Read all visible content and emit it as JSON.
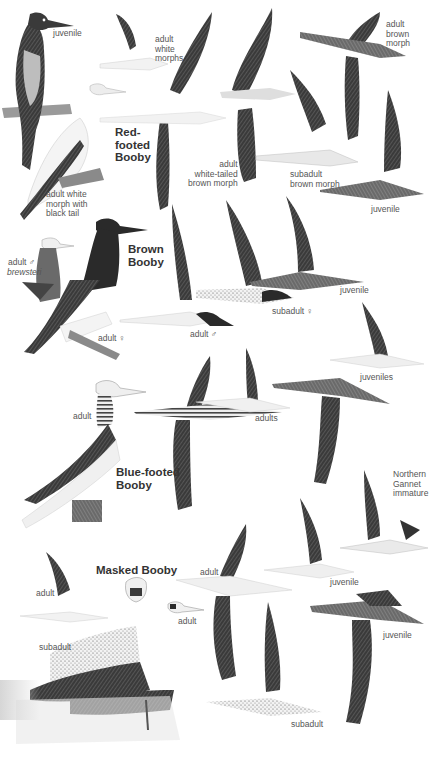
{
  "plate": {
    "title": "Boobies and Gannet identification plate",
    "colors": {
      "background": "#ffffff",
      "ink_dark": "#2a2a2a",
      "ink_mid": "#6a6a6a",
      "ink_light": "#bdbdbd",
      "label": "#555555"
    }
  },
  "species": [
    {
      "name": "Red-\nfooted\nBooby",
      "labels": [
        "juvenile",
        "adult\nwhite\nmorphs",
        "adult white\nmorph with\nblack tail",
        "adult\nwhite-tailed\nbrown morph",
        "adult\nbrown\nmorph",
        "subadult\nbrown morph",
        "juvenile"
      ]
    },
    {
      "name": "Brown\nBooby",
      "labels": [
        "adult ♂",
        "brewsteri",
        "adult ♀",
        "adult ♂",
        "subadult ♀",
        "juvenile"
      ]
    },
    {
      "name": "Blue-footed\nBooby",
      "labels": [
        "adult",
        "adults",
        "juveniles"
      ]
    },
    {
      "name": "Masked Booby",
      "labels": [
        "adult",
        "subadult",
        "adult",
        "adult",
        "juvenile",
        "juvenile",
        "subadult"
      ]
    },
    {
      "name": "Northern\nGannet\nimmature",
      "labels": []
    }
  ],
  "labels": {
    "rf_juvenile_perched": "juvenile",
    "rf_adult_white_morphs": "adult\nwhite\nmorphs",
    "rf_species": "Red-\nfooted\nBooby",
    "rf_black_tail": "adult white\nmorph with\nblack tail",
    "rf_white_tailed": "adult\nwhite-tailed\nbrown morph",
    "rf_brown_morph": "adult\nbrown\nmorph",
    "rf_subadult": "subadult\nbrown morph",
    "rf_juvenile_flying": "juvenile",
    "br_species": "Brown\nBooby",
    "br_adult_male_brewsteri_a": "adult ♂",
    "br_adult_male_brewsteri_b": "brewsteri",
    "br_adult_female": "adult ♀",
    "br_adult_male_flying": "adult ♂",
    "br_subadult_female": "subadult ♀",
    "br_juvenile": "juvenile",
    "bf_juveniles": "juveniles",
    "bf_adult_perched": "adult",
    "bf_adults": "adults",
    "bf_species": "Blue-footed\nBooby",
    "ng_label": "Northern\nGannet\nimmature",
    "mb_species": "Masked Booby",
    "mb_adult_flying_left": "adult",
    "mb_adult_flying_center": "adult",
    "mb_adult_head": "adult",
    "mb_subadult_perched": "subadult",
    "mb_juvenile_1": "juvenile",
    "mb_juvenile_2": "juvenile",
    "mb_subadult_flying": "subadult"
  }
}
